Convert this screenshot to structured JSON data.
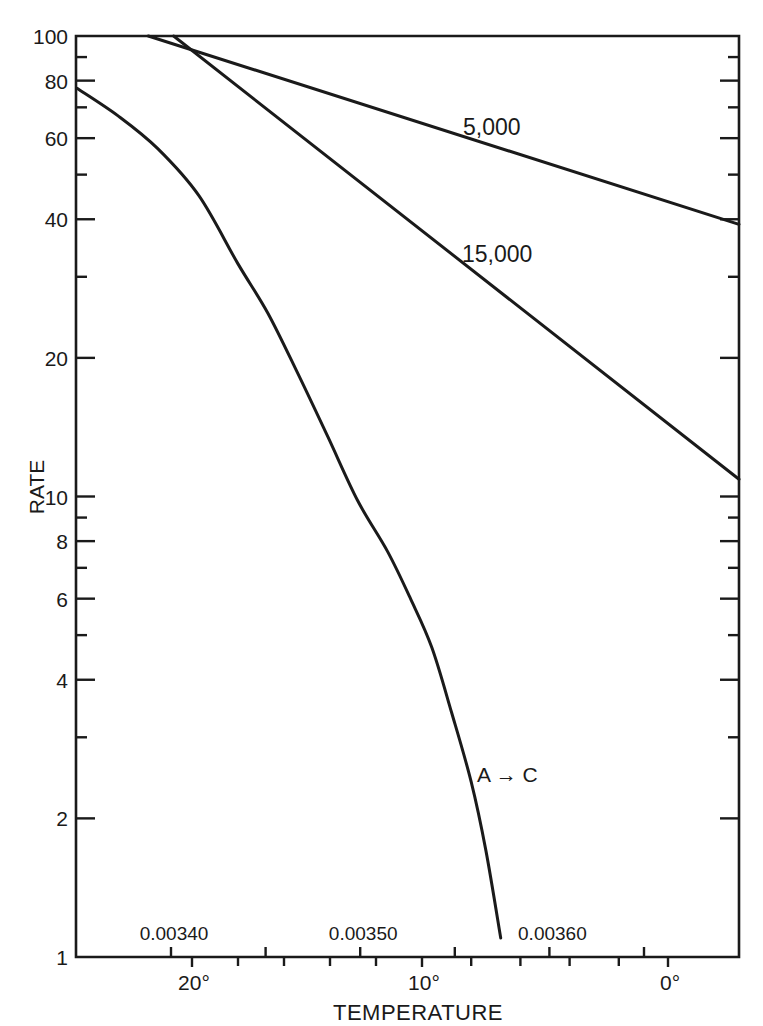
{
  "chart_data": {
    "type": "line",
    "title": "",
    "xlabel": "TEMPERATURE",
    "ylabel": "RATE",
    "y_scale": "log",
    "ylim": [
      1,
      100
    ],
    "xlim_celsius": [
      25,
      -3
    ],
    "grid": false,
    "legend": "inline labels",
    "y_ticks": [
      {
        "value": 100,
        "label": "100"
      },
      {
        "value": 80,
        "label": "80"
      },
      {
        "value": 60,
        "label": "60"
      },
      {
        "value": 40,
        "label": "40"
      },
      {
        "value": 20,
        "label": "20"
      },
      {
        "value": 10,
        "label": "10"
      },
      {
        "value": 8,
        "label": "8"
      },
      {
        "value": 6,
        "label": "6"
      },
      {
        "value": 4,
        "label": "4"
      },
      {
        "value": 2,
        "label": "2"
      },
      {
        "value": 1,
        "label": "1"
      }
    ],
    "y_minor_ticks": [
      90,
      70,
      50,
      30,
      9,
      7,
      5,
      3
    ],
    "x_temperature_ticks": [
      {
        "value": 20,
        "label": "20°"
      },
      {
        "value": 10,
        "label": "10°"
      },
      {
        "value": 0,
        "label": "0°"
      }
    ],
    "x_temperature_minor_ticks": [
      18,
      16,
      14,
      12,
      8,
      6,
      4,
      2
    ],
    "x_reciprocal_ticks": [
      {
        "value": 0.0034,
        "label": "0.00340"
      },
      {
        "value": 0.00345,
        "label": ""
      },
      {
        "value": 0.0035,
        "label": "0.00350"
      },
      {
        "value": 0.00355,
        "label": ""
      },
      {
        "value": 0.0036,
        "label": "0.00360"
      },
      {
        "value": 0.00365,
        "label": ""
      }
    ],
    "series": [
      {
        "name": "5,000",
        "label": "5,000",
        "kind": "straight",
        "points": [
          [
            21.9,
            100
          ],
          [
            -3,
            39
          ]
        ]
      },
      {
        "name": "15,000",
        "label": "15,000",
        "kind": "straight",
        "points": [
          [
            20.8,
            100
          ],
          [
            -3,
            10.9
          ]
        ]
      },
      {
        "name": "A→C",
        "label": "A → C",
        "kind": "curve",
        "points": [
          [
            25.0,
            77
          ],
          [
            23.2,
            67
          ],
          [
            21.5,
            57
          ],
          [
            19.7,
            45
          ],
          [
            18.0,
            32
          ],
          [
            16.7,
            25
          ],
          [
            15.4,
            18.5
          ],
          [
            14.1,
            13.5
          ],
          [
            12.8,
            9.8
          ],
          [
            11.5,
            7.6
          ],
          [
            10.5,
            6.0
          ],
          [
            9.6,
            4.7
          ],
          [
            8.8,
            3.4
          ],
          [
            8.0,
            2.4
          ],
          [
            7.4,
            1.7
          ],
          [
            6.8,
            1.1
          ]
        ]
      }
    ]
  },
  "labels": {
    "series_5000": "5,000",
    "series_15000": "15,000",
    "series_ac": "A → C",
    "xlabel": "TEMPERATURE",
    "ylabel": "RATE"
  }
}
